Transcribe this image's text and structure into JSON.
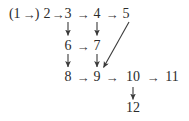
{
  "figure": {
    "kind": "directed-graph-diagram",
    "background_color": "#ffffff",
    "ink_color": "#2b2b2b",
    "width": 189,
    "height": 121
  },
  "nodes": {
    "n1": "1",
    "n2": "2",
    "n3": "3",
    "n4": "4",
    "n5": "5",
    "n6": "6",
    "n7": "7",
    "n8": "8",
    "n9": "9",
    "n10": "10",
    "n11": "11",
    "n12": "12"
  },
  "glyphs": {
    "paren_open": "(",
    "paren_close": ")",
    "arrow_right": "→",
    "arrow_down": "↓"
  },
  "rows": [
    {
      "name": "row-1",
      "text": "(1 →) 2 → 3 → 4 → 5",
      "labels": [
        "1",
        "2",
        "3",
        "4",
        "5"
      ]
    },
    {
      "name": "row-2",
      "text": "6 → 7",
      "labels": [
        "6",
        "7"
      ]
    },
    {
      "name": "row-3",
      "text": "8 → 9 → 10 → 11",
      "labels": [
        "8",
        "9",
        "10",
        "11"
      ]
    },
    {
      "name": "row-4",
      "text": "12",
      "labels": [
        "12"
      ]
    }
  ],
  "edges": [
    {
      "from": "1",
      "to": "2",
      "direction": "right",
      "parenthesized": true
    },
    {
      "from": "2",
      "to": "3",
      "direction": "right"
    },
    {
      "from": "3",
      "to": "4",
      "direction": "right"
    },
    {
      "from": "4",
      "to": "5",
      "direction": "right"
    },
    {
      "from": "3",
      "to": "6",
      "direction": "down"
    },
    {
      "from": "4",
      "to": "7",
      "direction": "down"
    },
    {
      "from": "6",
      "to": "7",
      "direction": "right"
    },
    {
      "from": "6",
      "to": "8",
      "direction": "down"
    },
    {
      "from": "7",
      "to": "9",
      "direction": "down"
    },
    {
      "from": "5",
      "to": "9",
      "direction": "diagonal-down-left"
    },
    {
      "from": "8",
      "to": "9",
      "direction": "right"
    },
    {
      "from": "9",
      "to": "10",
      "direction": "right"
    },
    {
      "from": "10",
      "to": "11",
      "direction": "right"
    },
    {
      "from": "10",
      "to": "12",
      "direction": "down"
    }
  ]
}
